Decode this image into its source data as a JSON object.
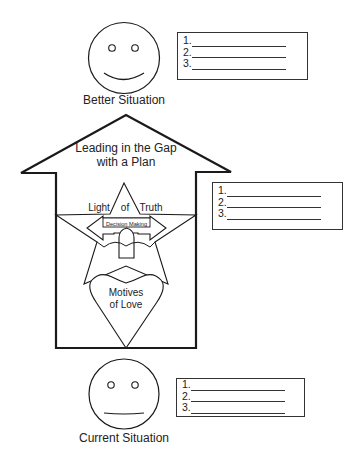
{
  "diagram": {
    "top_face": {
      "expression": "smile",
      "label": "Better Situation"
    },
    "bottom_face": {
      "expression": "neutral",
      "label": "Current Situation"
    },
    "house": {
      "title_line1": "Leading in the Gap",
      "title_line2": "with a Plan",
      "star_left_word": "Light",
      "star_mid_word": "of",
      "star_right_word": "Truth",
      "arrow_label": "Decision Making",
      "heart_line1": "Motives",
      "heart_line2": "of Love"
    },
    "lists": [
      {
        "name": "better-situation-list",
        "items": [
          "1.",
          "2.",
          "3."
        ]
      },
      {
        "name": "plan-list",
        "items": [
          "1.",
          "2.",
          "3."
        ]
      },
      {
        "name": "current-situation-list",
        "items": [
          "1.",
          "2.",
          "3."
        ]
      }
    ],
    "colors": {
      "line": "#1a1a1a",
      "background": "#ffffff",
      "text": "#222222"
    }
  }
}
